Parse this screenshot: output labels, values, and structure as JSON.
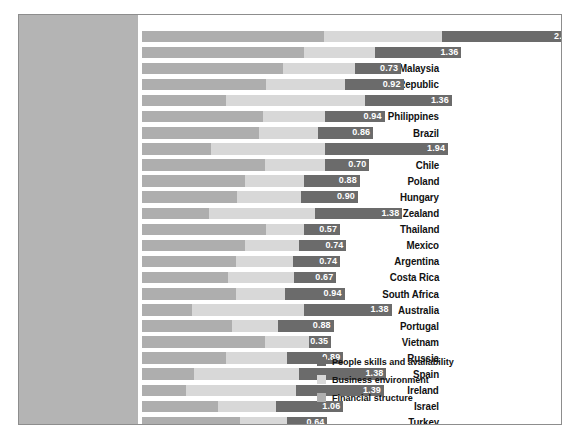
{
  "chart_data": {
    "type": "bar",
    "subtype": "stacked-horizontal",
    "title": "",
    "xlabel": "",
    "ylabel": "",
    "grid": false,
    "legend_position": "bottom-right",
    "value_label_note": "The white number printed on each bar is the value of the 'People skills and availability' (dark) segment.",
    "axis_note": "No numeric x-axis ticks are printed; bar lengths are relative composite scores.",
    "categories": [
      "India",
      "China",
      "Malaysia",
      "Czech Republic",
      "Singapore",
      "Philippines",
      "Brazil",
      "Canada",
      "Chile",
      "Poland",
      "Hungary",
      "New Zealand",
      "Thailand",
      "Mexico",
      "Argentina",
      "Costa Rica",
      "South Africa",
      "Australia",
      "Portugal",
      "Vietnam",
      "Russia",
      "Spain",
      "Ireland",
      "Israel",
      "Turkey"
    ],
    "series": [
      {
        "name": "Financial structure",
        "color": "#aeaeae",
        "values": [
          2.87,
          2.55,
          2.22,
          1.95,
          1.32,
          1.9,
          1.85,
          1.08,
          1.93,
          1.63,
          1.5,
          1.05,
          1.95,
          1.63,
          1.48,
          1.36,
          1.48,
          0.78,
          1.42,
          1.93,
          1.33,
          0.82,
          0.7,
          1.2,
          1.55
        ]
      },
      {
        "name": "Business environment",
        "color": "#d8d8d8",
        "values": [
          1.86,
          1.12,
          1.13,
          1.25,
          2.2,
          0.98,
          0.93,
          1.8,
          0.95,
          0.92,
          1.0,
          1.67,
          0.6,
          0.85,
          0.9,
          1.03,
          0.77,
          1.77,
          0.72,
          0.7,
          0.95,
          1.65,
          1.72,
          0.91,
          0.73
        ]
      },
      {
        "name": "People skills and availability",
        "color": "#6b6b6b",
        "values": [
          2.09,
          1.36,
          0.73,
          0.92,
          1.36,
          0.94,
          0.86,
          1.94,
          0.7,
          0.88,
          0.9,
          1.38,
          0.57,
          0.74,
          0.74,
          0.67,
          0.94,
          1.38,
          0.88,
          0.35,
          0.89,
          1.38,
          1.39,
          1.06,
          0.64
        ]
      }
    ],
    "totals": [
      6.82,
      5.03,
      4.08,
      4.12,
      4.88,
      3.82,
      3.64,
      4.82,
      3.58,
      3.43,
      3.4,
      4.1,
      3.12,
      3.22,
      3.12,
      3.06,
      3.19,
      3.93,
      3.02,
      2.98,
      3.17,
      3.85,
      3.81,
      3.17,
      2.92
    ],
    "value_labels": [
      "2.09",
      "1.36",
      "0.73",
      "0.92",
      "1.36",
      "0.94",
      "0.86",
      "1.94",
      "0.70",
      "0.88",
      "0.90",
      "1.38",
      "0.57",
      "0.74",
      "0.74",
      "0.67",
      "0.94",
      "1.38",
      "0.88",
      "0.35",
      "0.89",
      "1.38",
      "1.39",
      "1.06",
      "0.64"
    ],
    "xlim": [
      0,
      6.82
    ]
  },
  "legend": {
    "items": [
      {
        "label": "People skills and availability",
        "color": "#6b6b6b",
        "swatch": "people-swatch"
      },
      {
        "label": "Business environment",
        "color": "#d8d8d8",
        "swatch": "business-swatch"
      },
      {
        "label": "Financial structure",
        "color": "#aeaeae",
        "swatch": "financial-swatch"
      }
    ]
  },
  "style": {
    "label_panel_color": "#b4b4b4",
    "plot_background": "#ffffff",
    "frame_border": "#8d8d8d",
    "value_text_color": "#ffffff",
    "label_text_color": "#111111"
  }
}
